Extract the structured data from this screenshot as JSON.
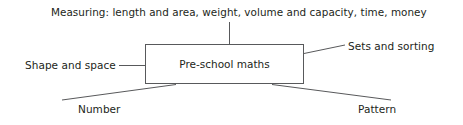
{
  "diagram": {
    "type": "concept-map",
    "central_node": {
      "label": "Pre-school maths"
    },
    "branches": [
      {
        "id": "measuring",
        "label": "Measuring: length and area, weight, volume and capacity, time, money",
        "position": "top",
        "connector": "vertical-line"
      },
      {
        "id": "shape-and-space",
        "label": "Shape and space",
        "position": "left",
        "connector": "horizontal-line"
      },
      {
        "id": "sets-and-sorting",
        "label": "Sets and sorting",
        "position": "right",
        "connector": "diagonal-line-up-right"
      },
      {
        "id": "number",
        "label": "Number",
        "position": "bottom-left",
        "connector": "diagonal-line-down-left"
      },
      {
        "id": "pattern",
        "label": "Pattern",
        "position": "bottom-right",
        "connector": "diagonal-line-down-right"
      }
    ],
    "colors": {
      "background": "#ffffff",
      "text": "#231f20",
      "line": "#58595b",
      "box_border": "#58595b"
    }
  }
}
